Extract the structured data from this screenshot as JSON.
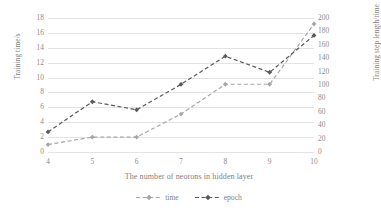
{
  "chart_data": {
    "type": "line",
    "title": "",
    "xlabel": "The number of neorons in hidden layer",
    "ylabel": "Training time/s",
    "y2label": "Training step length/time",
    "x": [
      4,
      5,
      6,
      7,
      8,
      9,
      10
    ],
    "xticklabels": [
      "4",
      "5",
      "6",
      "7",
      "8",
      "9",
      "10"
    ],
    "xlim": [
      4,
      10
    ],
    "ylim": [
      0,
      18
    ],
    "yticks": [
      0,
      2,
      4,
      6,
      8,
      10,
      12,
      14,
      16,
      18
    ],
    "yticklabels": [
      "0",
      "2",
      "4",
      "6",
      "8",
      "10",
      "12",
      "14",
      "16",
      "18"
    ],
    "y2lim": [
      0,
      200
    ],
    "y2ticks": [
      0,
      20,
      40,
      60,
      80,
      100,
      120,
      140,
      160,
      180,
      200
    ],
    "y2ticklabels": [
      "0",
      "20",
      "40",
      "60",
      "80",
      "100",
      "120",
      "140",
      "160",
      "180",
      "200"
    ],
    "grid": "horizontal",
    "legend_position": "bottom-center",
    "series": [
      {
        "name": "time",
        "axis": "left",
        "color": "#a6a6a6",
        "linestyle": "dashed",
        "marker": "diamond",
        "values": [
          1.0,
          2.0,
          2.0,
          5.1,
          9.1,
          9.1,
          17.2
        ]
      },
      {
        "name": "epoch",
        "axis": "right",
        "color": "#595959",
        "linestyle": "dashed",
        "marker": "diamond",
        "values": [
          30,
          75,
          63,
          101,
          143,
          119,
          174
        ]
      }
    ]
  },
  "legend": {
    "items": [
      {
        "label": "time"
      },
      {
        "label": "epoch"
      }
    ]
  }
}
